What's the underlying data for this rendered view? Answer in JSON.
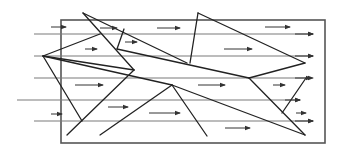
{
  "diagram": {
    "canvas": {
      "width": 342,
      "height": 154
    },
    "colors": {
      "frame": "#555555",
      "flow": "#7a7a7a",
      "edge": "#222222",
      "arrow": "#333333"
    },
    "frame": {
      "x": 61,
      "y": 20,
      "width": 264,
      "height": 123
    },
    "flow_lines": [
      {
        "x1": 34,
        "y1": 34,
        "x2": 313,
        "y2": 34
      },
      {
        "x1": 34,
        "y1": 56,
        "x2": 313,
        "y2": 56
      },
      {
        "x1": 34,
        "y1": 78,
        "x2": 313,
        "y2": 78
      },
      {
        "x1": 17,
        "y1": 100,
        "x2": 300,
        "y2": 100
      },
      {
        "x1": 34,
        "y1": 121,
        "x2": 313,
        "y2": 121
      }
    ],
    "arrows": [
      {
        "x1": 51,
        "y1": 27,
        "x2": 66,
        "y2": 27
      },
      {
        "x1": 100,
        "y1": 28,
        "x2": 117,
        "y2": 28
      },
      {
        "x1": 157,
        "y1": 28,
        "x2": 180,
        "y2": 28
      },
      {
        "x1": 265,
        "y1": 27,
        "x2": 290,
        "y2": 27
      },
      {
        "x1": 295,
        "y1": 34,
        "x2": 313,
        "y2": 34
      },
      {
        "x1": 85,
        "y1": 49,
        "x2": 97,
        "y2": 49
      },
      {
        "x1": 125,
        "y1": 42,
        "x2": 137,
        "y2": 42
      },
      {
        "x1": 224,
        "y1": 49,
        "x2": 252,
        "y2": 49
      },
      {
        "x1": 295,
        "y1": 56,
        "x2": 313,
        "y2": 56
      },
      {
        "x1": 75,
        "y1": 85,
        "x2": 103,
        "y2": 85
      },
      {
        "x1": 198,
        "y1": 85,
        "x2": 225,
        "y2": 85
      },
      {
        "x1": 273,
        "y1": 85,
        "x2": 285,
        "y2": 85
      },
      {
        "x1": 295,
        "y1": 78,
        "x2": 311,
        "y2": 78
      },
      {
        "x1": 108,
        "y1": 107,
        "x2": 128,
        "y2": 107
      },
      {
        "x1": 149,
        "y1": 113,
        "x2": 180,
        "y2": 113
      },
      {
        "x1": 51,
        "y1": 114,
        "x2": 62,
        "y2": 114
      },
      {
        "x1": 285,
        "y1": 100,
        "x2": 300,
        "y2": 100
      },
      {
        "x1": 296,
        "y1": 113,
        "x2": 306,
        "y2": 113
      },
      {
        "x1": 295,
        "y1": 121,
        "x2": 313,
        "y2": 121
      },
      {
        "x1": 225,
        "y1": 128,
        "x2": 250,
        "y2": 128
      }
    ],
    "edges": [
      {
        "x1": 83,
        "y1": 13,
        "x2": 187,
        "y2": 63
      },
      {
        "x1": 83,
        "y1": 13,
        "x2": 134,
        "y2": 70
      },
      {
        "x1": 124,
        "y1": 29,
        "x2": 117,
        "y2": 49
      },
      {
        "x1": 117,
        "y1": 49,
        "x2": 249,
        "y2": 78
      },
      {
        "x1": 43,
        "y1": 56,
        "x2": 100,
        "y2": 34
      },
      {
        "x1": 43,
        "y1": 56,
        "x2": 134,
        "y2": 70
      },
      {
        "x1": 43,
        "y1": 56,
        "x2": 82,
        "y2": 121
      },
      {
        "x1": 43,
        "y1": 56,
        "x2": 172,
        "y2": 85
      },
      {
        "x1": 134,
        "y1": 70,
        "x2": 67,
        "y2": 135
      },
      {
        "x1": 172,
        "y1": 85,
        "x2": 305,
        "y2": 135
      },
      {
        "x1": 172,
        "y1": 85,
        "x2": 100,
        "y2": 135
      },
      {
        "x1": 172,
        "y1": 85,
        "x2": 207,
        "y2": 136
      },
      {
        "x1": 198,
        "y1": 13,
        "x2": 190,
        "y2": 63
      },
      {
        "x1": 198,
        "y1": 13,
        "x2": 305,
        "y2": 63
      },
      {
        "x1": 305,
        "y1": 63,
        "x2": 249,
        "y2": 78
      },
      {
        "x1": 249,
        "y1": 78,
        "x2": 305,
        "y2": 135
      },
      {
        "x1": 282,
        "y1": 113,
        "x2": 306,
        "y2": 78
      }
    ]
  }
}
